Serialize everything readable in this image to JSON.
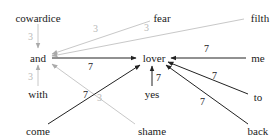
{
  "diagram": {
    "type": "word-graph",
    "colors": {
      "strong_edge": "#222222",
      "weak_edge": "#c8c8c8",
      "strong_label": "#222222",
      "weak_label": "#b8b8b8",
      "node_text": "#222222"
    },
    "nodes": [
      {
        "id": "cowardice",
        "label": "cowardice",
        "x": 38,
        "y": 18
      },
      {
        "id": "fear",
        "label": "fear",
        "x": 162,
        "y": 18
      },
      {
        "id": "filth",
        "label": "filth",
        "x": 258,
        "y": 18
      },
      {
        "id": "and",
        "label": "and",
        "x": 38,
        "y": 58
      },
      {
        "id": "lover",
        "label": "lover",
        "x": 154,
        "y": 58
      },
      {
        "id": "me",
        "label": "me",
        "x": 258,
        "y": 58
      },
      {
        "id": "with",
        "label": "with",
        "x": 38,
        "y": 95
      },
      {
        "id": "yes",
        "label": "yes",
        "x": 152,
        "y": 95
      },
      {
        "id": "to",
        "label": "to",
        "x": 258,
        "y": 98
      },
      {
        "id": "come",
        "label": "come",
        "x": 38,
        "y": 133
      },
      {
        "id": "shame",
        "label": "shame",
        "x": 152,
        "y": 133
      },
      {
        "id": "back",
        "label": "back",
        "x": 258,
        "y": 133
      }
    ],
    "edges": [
      {
        "from": "cowardice",
        "to": "and",
        "weight": "3",
        "style": "weak"
      },
      {
        "from": "with",
        "to": "and",
        "weight": "3",
        "style": "weak"
      },
      {
        "from": "fear",
        "to": "and",
        "weight": "3",
        "style": "weak"
      },
      {
        "from": "filth",
        "to": "and",
        "weight": "3",
        "style": "weak"
      },
      {
        "from": "shame",
        "to": "and",
        "weight": "3",
        "style": "weak"
      },
      {
        "from": "and",
        "to": "lover",
        "weight": "7",
        "style": "strong"
      },
      {
        "from": "me",
        "to": "lover",
        "weight": "7",
        "style": "strong"
      },
      {
        "from": "to",
        "to": "lover",
        "weight": "7",
        "style": "strong"
      },
      {
        "from": "back",
        "to": "lover",
        "weight": "7",
        "style": "strong"
      },
      {
        "from": "yes",
        "to": "lover",
        "weight": "7",
        "style": "strong"
      },
      {
        "from": "come",
        "to": "lover",
        "weight": "7",
        "style": "strong"
      }
    ]
  }
}
